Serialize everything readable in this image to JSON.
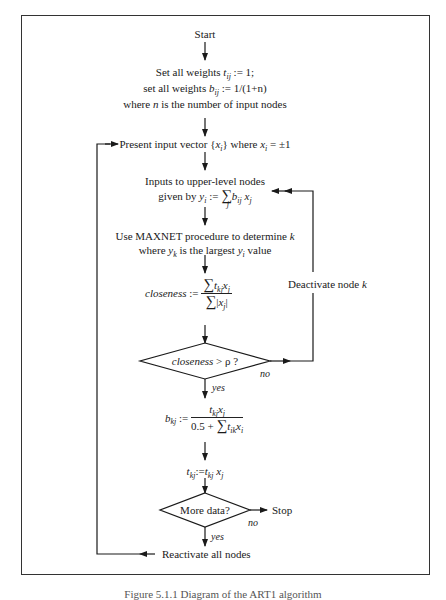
{
  "figure": {
    "caption": "Figure 5.1.1  Diagram of the ART1 algorithm",
    "line_color": "#222222",
    "background": "#ffffff"
  },
  "nodes": {
    "start": "Start",
    "init_line1_pre": "Set all weights ",
    "init_line1_var": "t",
    "init_line1_sub": "ij",
    "init_line1_post": " := 1;",
    "init_line2_pre": "set all weights ",
    "init_line2_var": "b",
    "init_line2_sub": "ij",
    "init_line2_post": " := 1/(1+n)",
    "init_line3_pre": "where ",
    "init_line3_var": "n",
    "init_line3_post": " is the number of input nodes",
    "present_pre": "Present input vector {",
    "present_var": "x",
    "present_sub": "i",
    "present_mid": "} where ",
    "present_var2": "x",
    "present_sub2": "i",
    "present_post": " = ±1",
    "inputs_line1": "Inputs to upper-level nodes",
    "inputs_line2_pre": "given by ",
    "inputs_line2_formula": "y_i := Σ_j b_ij x_j",
    "maxnet_line1_pre": "Use MAXNET procedure to determine ",
    "maxnet_line1_var": "k",
    "maxnet_line2": "where y_k is the largest y_i value",
    "closeness_label": "closeness :=",
    "closeness_num": "Σ_j t_kj x_j",
    "closeness_den": "Σ_j |x_j|",
    "decision1": "closeness > ρ ?",
    "decision1_yes": "yes",
    "decision1_no": "no",
    "deactivate": "Deactivate node k",
    "update_b_label": "b_kj :=",
    "update_b_num": "t_kj x_j",
    "update_b_den": "0.5 + Σ_i t_ik x_i",
    "update_t": "t_kj := t_kj x_j",
    "decision2": "More data?",
    "decision2_yes": "yes",
    "decision2_no": "no",
    "stop": "Stop",
    "reactivate": "Reactivate all nodes"
  }
}
